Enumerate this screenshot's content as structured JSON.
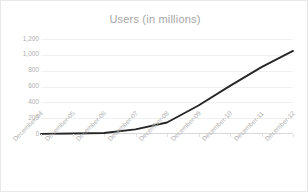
{
  "chart_data": {
    "type": "line",
    "title": "Users (in millions)",
    "xlabel": "",
    "ylabel": "",
    "categories": [
      "December-04",
      "December-05",
      "December-06",
      "December-07",
      "December-08",
      "December-09",
      "December-10",
      "December-11",
      "December-12"
    ],
    "values": [
      1,
      6,
      12,
      58,
      145,
      360,
      608,
      845,
      1050
    ],
    "series": [
      {
        "name": "Users (in millions)",
        "values": [
          1,
          6,
          12,
          58,
          145,
          360,
          608,
          845,
          1050
        ]
      }
    ],
    "ylim": [
      0,
      1200
    ],
    "yticks": [
      0,
      200,
      400,
      600,
      800,
      1000,
      1200
    ],
    "ytick_labels": [
      "0",
      "200",
      "400",
      "600",
      "800",
      "1,000",
      "1,200"
    ],
    "grid": true,
    "legend": false,
    "legend_position": "none",
    "line_color": "#262626",
    "grid_color": "#f0f0f0",
    "axis_color": "#d9d9d9",
    "text_color": "#b0b0b0",
    "background": "#ffffff",
    "border_color": "#e8e8e8"
  }
}
